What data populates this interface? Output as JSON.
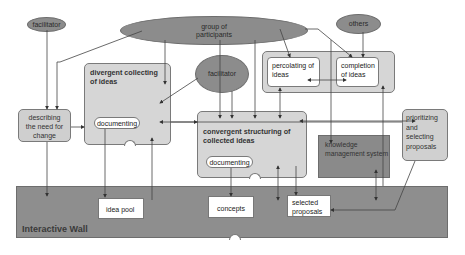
{
  "diagram": {
    "title": "Interactive Wall",
    "actors": {
      "facilitator_left": "facilitator",
      "group": "group of participants",
      "facilitator_center": "facilitator",
      "others": "others"
    },
    "processes": {
      "describing": "describing the need for change",
      "divergent": {
        "title": "divergent collecting of ideas",
        "sub": "documenting"
      },
      "convergent": {
        "title": "convergent structuring of collected ideas",
        "sub": "documenting"
      },
      "percolating_group": {
        "percolating": "percolating of ideas",
        "completion": "completion of ideas"
      },
      "prioritizing": "prioritizing and selecting proposals",
      "kms": "knowledge management system"
    },
    "wall": {
      "label": "Interactive Wall",
      "items": {
        "idea_pool": "idea pool",
        "concepts": "concepts",
        "selected": "selected proposals"
      }
    }
  }
}
